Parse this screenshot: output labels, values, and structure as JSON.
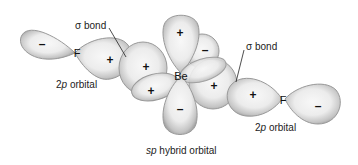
{
  "labels": {
    "sigma_bond_left": "σ bond",
    "sigma_bond_right": "σ bond",
    "p_orbital_left": "2p orbital",
    "p_orbital_right": "2p orbital",
    "sp_hybrid": "sp hybrid orbital"
  },
  "label_parts": {
    "p_orbital_left": {
      "italic": "p",
      "prefix": "2",
      "suffix": " orbital"
    },
    "p_orbital_right": {
      "italic": "p",
      "prefix": "2",
      "suffix": " orbital"
    },
    "sp_hybrid": {
      "italic": "sp",
      "suffix": " hybrid orbital"
    }
  },
  "atoms": {
    "left_fluorine": "F",
    "beryllium": "Be",
    "right_fluorine": "F"
  },
  "signs": {
    "left_f_outer": "–",
    "left_f_inner": "+",
    "be_left_hybrid": "+",
    "be_left_lower": "+",
    "be_top": "+",
    "be_top_right": "–",
    "be_right_hybrid": "+",
    "be_bottom": "–",
    "right_f_inner": "+",
    "right_f_outer": "–"
  },
  "colors": {
    "lobe_fill_center": "#f4f4f4",
    "lobe_fill_edge": "#a8a8a8",
    "lobe_stroke": "#8a8a8a",
    "text": "#222222"
  }
}
